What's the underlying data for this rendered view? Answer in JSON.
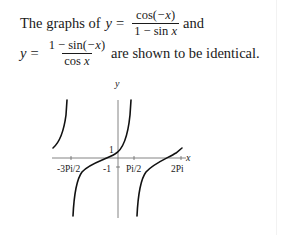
{
  "statement": {
    "line1": {
      "prefix": "The graphs of",
      "var_y": "y",
      "equals": "=",
      "fraction": {
        "numerator_fn": "cos(",
        "numerator_arg": "−x",
        "numerator_close": ")",
        "denominator_pre": "1 − sin ",
        "denominator_var": "x"
      },
      "suffix": "and"
    },
    "line2": {
      "var_y": "y",
      "equals": "=",
      "fraction": {
        "numerator_pre": "1 − sin(",
        "numerator_arg": "−x",
        "numerator_close": ")",
        "denominator_pre": "cos ",
        "denominator_var": "x"
      },
      "suffix": "are shown to be identical."
    }
  },
  "graph": {
    "y_axis_label": "y",
    "x_axis_label": "x",
    "y_tick_label": "1",
    "x_tick_labels": [
      "-3Pi/2",
      "-1",
      "Pi/2",
      "2Pi"
    ],
    "curve_color": "#111111",
    "axis_color": "#555555"
  }
}
